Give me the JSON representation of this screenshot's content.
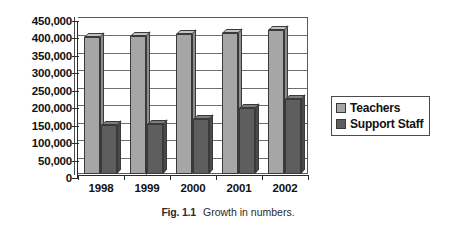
{
  "caption": {
    "number": "Fig. 1.1",
    "text": "Growth in numbers."
  },
  "legend": {
    "items": [
      {
        "label": "Teachers",
        "color": "#a6a6a6"
      },
      {
        "label": "Support Staff",
        "color": "#5e5e5e"
      }
    ]
  },
  "chart_data": {
    "type": "bar",
    "title": "",
    "subtitle": "",
    "xlabel": "",
    "ylabel": "",
    "categories": [
      "1998",
      "1999",
      "2000",
      "2001",
      "2002"
    ],
    "series": [
      {
        "name": "Teachers",
        "color": "#a6a6a6",
        "values": [
          393000,
          397000,
          400000,
          404000,
          412000
        ]
      },
      {
        "name": "Support Staff",
        "color": "#5e5e5e",
        "values": [
          140000,
          143000,
          158000,
          188000,
          214000
        ]
      }
    ],
    "ylim": [
      0,
      450000
    ],
    "ytick_step": 50000,
    "ytick_labels": [
      "450,000",
      "400,000",
      "350,000",
      "300,000",
      "250,000",
      "200,000",
      "150,000",
      "100,000",
      "50,000",
      "0"
    ],
    "ytick_values": [
      450000,
      400000,
      350000,
      300000,
      250000,
      200000,
      150000,
      100000,
      50000,
      0
    ],
    "grid": true,
    "legend_position": "right",
    "style": "3d-column"
  }
}
